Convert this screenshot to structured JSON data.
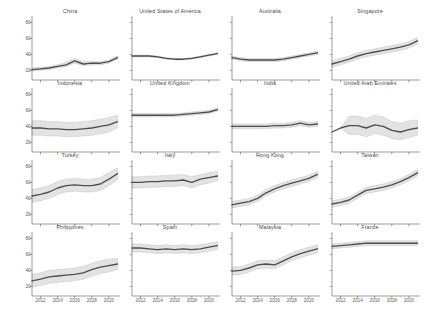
{
  "figure": {
    "grid": {
      "rows": 4,
      "cols": 4
    },
    "y_axis": {
      "ticks": [
        20,
        40,
        60,
        80
      ],
      "min": 8,
      "max": 88,
      "label": ""
    },
    "x_axis": {
      "ticks": [
        2012,
        2014,
        2016,
        2018,
        2020
      ],
      "min": 2011,
      "max": 2021.3,
      "label": ""
    }
  },
  "chart_data": {
    "type": "line",
    "title": "",
    "xlabel": "",
    "ylabel": "",
    "xlim": [
      2011,
      2021.3
    ],
    "ylim": [
      8,
      88
    ],
    "grid": false,
    "legend": "none",
    "xticks": [
      2012,
      2014,
      2016,
      2018,
      2020
    ],
    "yticks": [
      20,
      40,
      60,
      80
    ],
    "x": [
      2011,
      2012,
      2013,
      2014,
      2015,
      2016,
      2017,
      2018,
      2019,
      2020,
      2021
    ],
    "band_description": "shaded grey ribbon = uncertainty interval around dark grey mean line",
    "panels": [
      {
        "title": "China",
        "row": 1,
        "col": 1,
        "mean": [
          21,
          22,
          23,
          25,
          27,
          32,
          28,
          29,
          29,
          31,
          36
        ],
        "lower": [
          19,
          20,
          21,
          23,
          25,
          29,
          26,
          27,
          27,
          29,
          34
        ],
        "upper": [
          23,
          24,
          25,
          27,
          30,
          35,
          31,
          31,
          31,
          33,
          38
        ]
      },
      {
        "title": "United States of America",
        "row": 1,
        "col": 2,
        "mean": [
          38,
          38,
          38,
          37,
          35,
          34,
          34,
          35,
          37,
          39,
          41
        ],
        "lower": [
          37,
          37,
          37,
          36,
          34,
          33,
          33,
          34,
          36,
          38,
          40
        ],
        "upper": [
          39,
          39,
          39,
          38,
          36,
          35,
          35,
          36,
          38,
          40,
          42
        ]
      },
      {
        "title": "Australia",
        "row": 1,
        "col": 3,
        "mean": [
          36,
          34,
          33,
          33,
          33,
          33,
          34,
          36,
          38,
          40,
          42
        ],
        "lower": [
          34,
          32,
          31,
          31,
          31,
          31,
          32,
          34,
          36,
          38,
          40
        ],
        "upper": [
          38,
          36,
          35,
          35,
          35,
          35,
          36,
          38,
          40,
          42,
          44
        ]
      },
      {
        "title": "Singapore",
        "row": 1,
        "col": 4,
        "mean": [
          28,
          31,
          34,
          38,
          41,
          43,
          45,
          47,
          49,
          52,
          57
        ],
        "lower": [
          24,
          27,
          30,
          34,
          37,
          39,
          41,
          43,
          45,
          48,
          53
        ],
        "upper": [
          32,
          35,
          38,
          42,
          45,
          47,
          49,
          51,
          53,
          56,
          61
        ]
      },
      {
        "title": "Indonesia",
        "row": 2,
        "col": 1,
        "mean": [
          38,
          38,
          37,
          37,
          36,
          36,
          37,
          38,
          40,
          42,
          46
        ],
        "lower": [
          29,
          29,
          28,
          28,
          27,
          27,
          28,
          29,
          31,
          33,
          38
        ],
        "upper": [
          47,
          47,
          46,
          46,
          45,
          45,
          46,
          47,
          49,
          51,
          54
        ]
      },
      {
        "title": "United Kingdom",
        "row": 2,
        "col": 2,
        "mean": [
          54,
          54,
          54,
          54,
          54,
          54,
          55,
          56,
          57,
          58,
          61
        ],
        "lower": [
          52,
          52,
          52,
          52,
          52,
          52,
          53,
          54,
          55,
          56,
          59
        ],
        "upper": [
          56,
          56,
          56,
          56,
          56,
          56,
          57,
          58,
          59,
          60,
          63
        ]
      },
      {
        "title": "India",
        "row": 2,
        "col": 3,
        "mean": [
          40,
          40,
          40,
          40,
          40,
          41,
          41,
          42,
          44,
          42,
          43
        ],
        "lower": [
          37,
          37,
          37,
          37,
          37,
          38,
          38,
          39,
          41,
          39,
          40
        ],
        "upper": [
          43,
          43,
          43,
          43,
          43,
          44,
          44,
          45,
          47,
          45,
          46
        ]
      },
      {
        "title": "United Arab Emirates",
        "row": 2,
        "col": 4,
        "mean": [
          33,
          38,
          41,
          41,
          38,
          42,
          40,
          35,
          33,
          36,
          38
        ],
        "lower": [
          33,
          38,
          30,
          30,
          27,
          31,
          29,
          25,
          23,
          26,
          29
        ],
        "upper": [
          33,
          38,
          53,
          53,
          50,
          54,
          52,
          46,
          44,
          47,
          48
        ]
      },
      {
        "title": "Turkey",
        "row": 3,
        "col": 1,
        "mean": [
          43,
          45,
          48,
          53,
          56,
          57,
          56,
          56,
          58,
          64,
          71
        ],
        "lower": [
          35,
          37,
          40,
          45,
          48,
          49,
          48,
          48,
          50,
          56,
          64
        ],
        "upper": [
          51,
          53,
          56,
          61,
          64,
          65,
          64,
          64,
          66,
          72,
          78
        ]
      },
      {
        "title": "Italy",
        "row": 3,
        "col": 2,
        "mean": [
          60,
          60,
          61,
          61,
          62,
          62,
          63,
          60,
          64,
          66,
          68
        ],
        "lower": [
          53,
          53,
          54,
          54,
          55,
          55,
          56,
          53,
          57,
          59,
          62
        ],
        "upper": [
          67,
          67,
          68,
          68,
          69,
          69,
          70,
          67,
          70,
          72,
          74
        ]
      },
      {
        "title": "Hong Kong",
        "row": 3,
        "col": 3,
        "mean": [
          32,
          34,
          36,
          40,
          47,
          52,
          56,
          59,
          62,
          65,
          70
        ],
        "lower": [
          28,
          30,
          32,
          36,
          43,
          48,
          52,
          55,
          58,
          61,
          66
        ],
        "upper": [
          36,
          38,
          40,
          44,
          51,
          56,
          60,
          63,
          66,
          69,
          74
        ]
      },
      {
        "title": "Taiwan",
        "row": 3,
        "col": 4,
        "mean": [
          33,
          35,
          38,
          44,
          50,
          52,
          54,
          57,
          61,
          66,
          72
        ],
        "lower": [
          29,
          31,
          34,
          40,
          46,
          48,
          50,
          53,
          57,
          62,
          68
        ],
        "upper": [
          37,
          39,
          42,
          48,
          54,
          56,
          58,
          61,
          65,
          70,
          76
        ]
      },
      {
        "title": "Philippines",
        "row": 4,
        "col": 1,
        "mean": [
          27,
          29,
          32,
          33,
          34,
          35,
          37,
          41,
          44,
          46,
          48
        ],
        "lower": [
          19,
          21,
          24,
          25,
          26,
          27,
          29,
          33,
          36,
          38,
          41
        ],
        "upper": [
          35,
          37,
          40,
          41,
          42,
          43,
          45,
          49,
          52,
          54,
          55
        ]
      },
      {
        "title": "Spain",
        "row": 4,
        "col": 2,
        "mean": [
          68,
          68,
          67,
          66,
          67,
          66,
          67,
          66,
          67,
          69,
          71
        ],
        "lower": [
          63,
          63,
          62,
          61,
          62,
          61,
          62,
          61,
          62,
          64,
          66
        ],
        "upper": [
          73,
          73,
          72,
          71,
          72,
          71,
          72,
          71,
          72,
          74,
          76
        ]
      },
      {
        "title": "Malaysia",
        "row": 4,
        "col": 3,
        "mean": [
          39,
          40,
          43,
          47,
          48,
          47,
          52,
          57,
          61,
          64,
          67
        ],
        "lower": [
          34,
          35,
          38,
          42,
          43,
          42,
          47,
          52,
          56,
          59,
          62
        ],
        "upper": [
          44,
          45,
          48,
          52,
          53,
          52,
          57,
          62,
          66,
          69,
          72
        ]
      },
      {
        "title": "France",
        "row": 4,
        "col": 4,
        "mean": [
          70,
          71,
          72,
          73,
          74,
          74,
          74,
          74,
          74,
          74,
          74
        ],
        "lower": [
          67,
          68,
          69,
          70,
          71,
          71,
          71,
          71,
          71,
          71,
          71
        ],
        "upper": [
          73,
          74,
          75,
          76,
          77,
          77,
          77,
          77,
          77,
          77,
          77
        ]
      }
    ]
  }
}
